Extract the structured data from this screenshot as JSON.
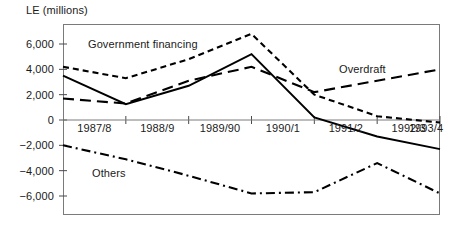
{
  "chart_data": {
    "type": "line",
    "title": "",
    "ylabel": "LE (millions)",
    "xlabel": "",
    "categories": [
      "1987/8",
      "1988/9",
      "1989/90",
      "1990/1",
      "1991/2",
      "1992/3",
      "1993/4"
    ],
    "ylim": [
      -7000,
      7400
    ],
    "yticks": [
      6000,
      4000,
      2000,
      0,
      -2000,
      -4000,
      -6000
    ],
    "ytick_labels": [
      "6,000",
      "4,000",
      "2,000",
      "0",
      "-2,000",
      "-4,000",
      "-6,000"
    ],
    "grid": false,
    "zero_line": true,
    "legend_position": "inline-annotations",
    "annotations": [
      {
        "text": "Government financing",
        "series": "government-financing"
      },
      {
        "text": "Overdraft",
        "series": "overdraft"
      },
      {
        "text": "Others",
        "series": "others"
      }
    ],
    "series": [
      {
        "name": "Government financing",
        "style": "dotted",
        "color": "#000000",
        "x": [
          "1987/8",
          "1988/9",
          "1989/90",
          "1990/1",
          "1991/2",
          "1992/3",
          "1993/4"
        ],
        "values": [
          4200,
          3300,
          4800,
          6800,
          2000,
          300,
          -200
        ]
      },
      {
        "name": "Overdraft",
        "style": "dashed",
        "color": "#000000",
        "x": [
          "1987/8",
          "1988/9",
          "1989/90",
          "1990/1",
          "1991/2",
          "1992/3",
          "1993/4"
        ],
        "values": [
          1700,
          1300,
          3100,
          4200,
          2200,
          3100,
          4000
        ]
      },
      {
        "name": "Solid series",
        "style": "solid",
        "color": "#000000",
        "x": [
          "1987/8",
          "1988/9",
          "1989/90",
          "1990/1",
          "1991/2",
          "1992/3",
          "1993/4"
        ],
        "values": [
          3500,
          1250,
          2700,
          5200,
          200,
          -1300,
          -2300
        ]
      },
      {
        "name": "Others",
        "style": "dash-dot",
        "color": "#000000",
        "x": [
          "1987/8",
          "1988/9",
          "1989/90",
          "1990/1",
          "1991/2",
          "1992/3",
          "1993/4"
        ],
        "values": [
          -2000,
          -3100,
          -4400,
          -5800,
          -5700,
          -3400,
          -5800
        ]
      }
    ]
  },
  "labels": {
    "y_axis_title": "LE (millions)",
    "government_financing": "Government financing",
    "overdraft": "Overdraft",
    "others": "Others"
  }
}
